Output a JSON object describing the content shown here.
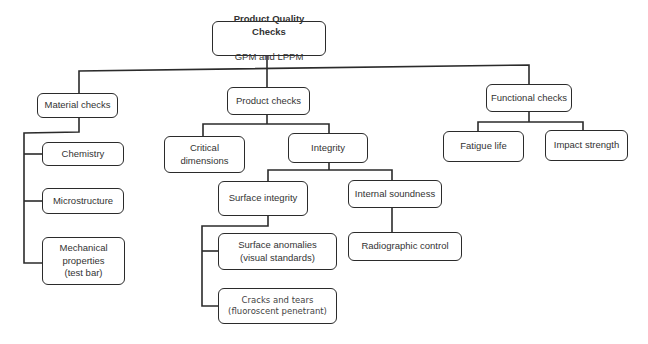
{
  "diagram": {
    "type": "hierarchy-tree",
    "root": {
      "title": "Product Quality Checks",
      "subtitle": "GPM and LPPM"
    },
    "nodes": {
      "material_checks": "Material checks",
      "chemistry": "Chemistry",
      "microstructure": "Microstructure",
      "mechanical_properties": "Mechanical\nproperties\n(test bar)",
      "product_checks": "Product checks",
      "critical_dimensions": "Critical\ndimensions",
      "integrity": "Integrity",
      "surface_integrity": "Surface integrity",
      "surface_anomalies": "Surface anomalies\n(visual standards)",
      "cracks_and_tears": "Cracks and tears\n(fluoroscent penetrant)",
      "internal_soundness": "Internal soundness",
      "radiographic_control": "Radiographic control",
      "functional_checks": "Functional checks",
      "fatigue_life": "Fatigue life",
      "impact_strength": "Impact strength"
    },
    "edges": [
      [
        "root",
        "material_checks"
      ],
      [
        "root",
        "product_checks"
      ],
      [
        "root",
        "functional_checks"
      ],
      [
        "material_checks",
        "chemistry"
      ],
      [
        "material_checks",
        "microstructure"
      ],
      [
        "material_checks",
        "mechanical_properties"
      ],
      [
        "product_checks",
        "critical_dimensions"
      ],
      [
        "product_checks",
        "integrity"
      ],
      [
        "integrity",
        "surface_integrity"
      ],
      [
        "integrity",
        "internal_soundness"
      ],
      [
        "surface_integrity",
        "surface_anomalies"
      ],
      [
        "surface_integrity",
        "cracks_and_tears"
      ],
      [
        "internal_soundness",
        "radiographic_control"
      ],
      [
        "functional_checks",
        "fatigue_life"
      ],
      [
        "functional_checks",
        "impact_strength"
      ]
    ],
    "colors": {
      "line": "#2b2b2b",
      "box_fill": "#ffffff",
      "text": "#333333"
    }
  }
}
